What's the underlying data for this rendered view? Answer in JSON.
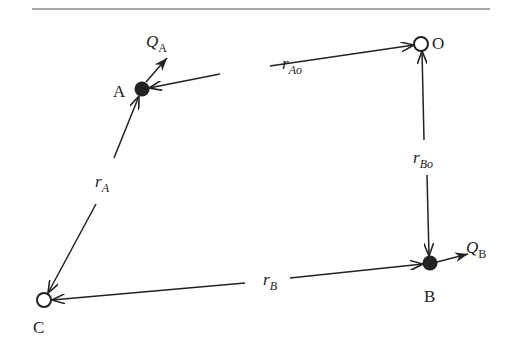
{
  "diagram": {
    "nodes": {
      "O": {
        "label": "O",
        "type": "open-circle"
      },
      "A": {
        "label": "A",
        "type": "filled-dot"
      },
      "B": {
        "label": "B",
        "type": "filled-dot"
      },
      "C": {
        "label": "C",
        "type": "open-circle"
      }
    },
    "flows": {
      "QA": {
        "main": "Q",
        "sub": "A"
      },
      "QB": {
        "main": "Q",
        "sub": "B"
      }
    },
    "edges": {
      "rAo": {
        "main": "r",
        "sub": "Ao"
      },
      "rBo": {
        "main": "r",
        "sub": "Bo"
      },
      "rA": {
        "main": "r",
        "sub": "A"
      },
      "rB": {
        "main": "r",
        "sub": "B"
      }
    },
    "colors": {
      "stroke": "#222222",
      "rule": "#888888"
    }
  }
}
